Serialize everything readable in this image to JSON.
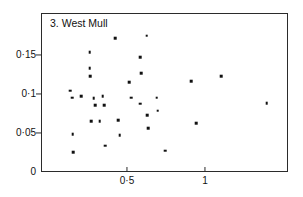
{
  "chart_data": {
    "type": "scatter",
    "title": "3. West Mull",
    "xlabel": "",
    "ylabel": "",
    "xlim": [
      -0.05,
      1.53
    ],
    "ylim": [
      0,
      0.204
    ],
    "grid": false,
    "legend": null,
    "xticks": [
      0.5,
      1
    ],
    "xticklabels": [
      "0·5",
      "1"
    ],
    "yticks": [
      0,
      0.05,
      0.1,
      0.15
    ],
    "yticklabels": [
      "0",
      "0·05",
      "0·1",
      "0·15"
    ],
    "decimal_separator": "middle-dot",
    "marker": "square",
    "marker_color": "#111111",
    "points": [
      {
        "x": 0.135,
        "y": 0.104
      },
      {
        "x": 0.147,
        "y": 0.0955
      },
      {
        "x": 0.205,
        "y": 0.0975
      },
      {
        "x": 0.152,
        "y": 0.0485
      },
      {
        "x": 0.157,
        "y": 0.0255
      },
      {
        "x": 0.26,
        "y": 0.1535
      },
      {
        "x": 0.262,
        "y": 0.133
      },
      {
        "x": 0.264,
        "y": 0.1225
      },
      {
        "x": 0.287,
        "y": 0.0945
      },
      {
        "x": 0.295,
        "y": 0.0855
      },
      {
        "x": 0.272,
        "y": 0.0655
      },
      {
        "x": 0.325,
        "y": 0.0655
      },
      {
        "x": 0.345,
        "y": 0.0975
      },
      {
        "x": 0.352,
        "y": 0.0855
      },
      {
        "x": 0.36,
        "y": 0.0335
      },
      {
        "x": 0.423,
        "y": 0.1715
      },
      {
        "x": 0.443,
        "y": 0.0665
      },
      {
        "x": 0.452,
        "y": 0.0475
      },
      {
        "x": 0.513,
        "y": 0.1155
      },
      {
        "x": 0.528,
        "y": 0.0955
      },
      {
        "x": 0.585,
        "y": 0.1475
      },
      {
        "x": 0.59,
        "y": 0.1265
      },
      {
        "x": 0.585,
        "y": 0.0875
      },
      {
        "x": 0.625,
        "y": 0.1745
      },
      {
        "x": 0.628,
        "y": 0.0725
      },
      {
        "x": 0.635,
        "y": 0.0565
      },
      {
        "x": 0.69,
        "y": 0.0955
      },
      {
        "x": 0.697,
        "y": 0.0785
      },
      {
        "x": 0.745,
        "y": 0.0275
      },
      {
        "x": 0.91,
        "y": 0.1165
      },
      {
        "x": 0.945,
        "y": 0.0625
      },
      {
        "x": 1.105,
        "y": 0.1225
      },
      {
        "x": 1.395,
        "y": 0.0885
      }
    ]
  },
  "axes": {
    "panel_label": "3. West Mull"
  }
}
